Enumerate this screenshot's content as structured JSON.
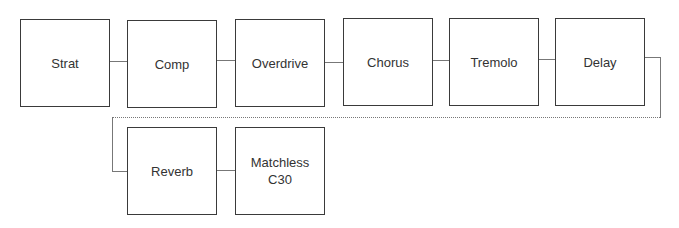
{
  "diagram": {
    "nodes": [
      {
        "id": "strat",
        "label": "Strat"
      },
      {
        "id": "comp",
        "label": "Comp"
      },
      {
        "id": "overdrive",
        "label": "Overdrive"
      },
      {
        "id": "chorus",
        "label": "Chorus"
      },
      {
        "id": "tremolo",
        "label": "Tremolo"
      },
      {
        "id": "delay",
        "label": "Delay"
      },
      {
        "id": "reverb",
        "label": "Reverb"
      },
      {
        "id": "matchless",
        "label": "Matchless\nC30"
      }
    ],
    "edges": [
      [
        "strat",
        "comp"
      ],
      [
        "comp",
        "overdrive"
      ],
      [
        "overdrive",
        "chorus"
      ],
      [
        "chorus",
        "tremolo"
      ],
      [
        "tremolo",
        "delay"
      ],
      [
        "delay",
        "reverb"
      ],
      [
        "reverb",
        "matchless"
      ]
    ]
  }
}
